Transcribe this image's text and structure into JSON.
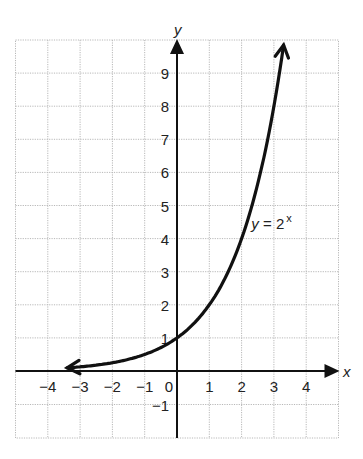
{
  "chart_data": {
    "type": "line",
    "title": "",
    "xlabel": "x",
    "ylabel": "y",
    "xlim": [
      -5,
      5
    ],
    "ylim": [
      -2,
      10
    ],
    "grid": true,
    "x_ticks": [
      -4,
      -3,
      -2,
      -1,
      0,
      1,
      2,
      3,
      4
    ],
    "y_ticks": [
      -1,
      1,
      2,
      3,
      4,
      5,
      6,
      7,
      8,
      9
    ],
    "series": [
      {
        "name": "y = 2^x",
        "function": "2^x",
        "x": [
          -3.4,
          -3,
          -2,
          -1,
          0,
          1,
          2,
          3,
          3.3
        ],
        "y": [
          0.09,
          0.125,
          0.25,
          0.5,
          1,
          2,
          4,
          8,
          9.85
        ],
        "arrows": "both ends"
      }
    ],
    "annotations": [
      {
        "text": "y = 2",
        "superscript": "x",
        "x": 2.3,
        "y": 4.3
      }
    ]
  }
}
